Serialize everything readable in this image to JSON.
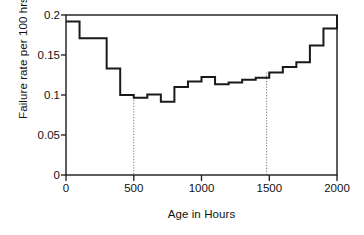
{
  "chart_data": {
    "type": "line",
    "subtype": "step-post",
    "title": "",
    "xlabel": "Age in Hours",
    "ylabel": "Failure rate per 100 hrs",
    "xlim": [
      0,
      2000
    ],
    "ylim": [
      0,
      0.2
    ],
    "grid": false,
    "legend": null,
    "xticks": [
      0,
      500,
      1000,
      1500,
      2000
    ],
    "xticklabels": [
      "0",
      "500",
      "1000",
      "1500",
      "2000"
    ],
    "yticks": [
      0,
      0.05,
      0.1,
      0.15,
      0.2
    ],
    "yticklabels": [
      "0",
      "0.05",
      "0.1",
      "0.15",
      "0.2"
    ],
    "bin_width": 100,
    "x": [
      0,
      100,
      200,
      300,
      400,
      500,
      600,
      700,
      800,
      900,
      1000,
      1100,
      1200,
      1300,
      1400,
      1500,
      1600,
      1700,
      1800,
      1900,
      2000
    ],
    "values": [
      0.192,
      0.171,
      0.171,
      0.133,
      0.1,
      0.0965,
      0.1005,
      0.0915,
      0.11,
      0.117,
      0.1225,
      0.1135,
      0.1155,
      0.119,
      0.1215,
      0.128,
      0.135,
      0.141,
      0.162,
      0.183,
      0.2
    ],
    "annotations": [
      {
        "name": "reference-line-500",
        "type": "vline",
        "x": 500,
        "y_top": 0.097,
        "y_bottom": 0,
        "style": "dotted"
      },
      {
        "name": "reference-line-1480",
        "type": "vline",
        "x": 1480,
        "y_top": 0.128,
        "y_bottom": 0,
        "style": "dotted"
      }
    ],
    "colors": {
      "line": "#1a1a1a",
      "frame": "#1a1a1a",
      "reference": "#777777",
      "background": "#ffffff"
    }
  }
}
